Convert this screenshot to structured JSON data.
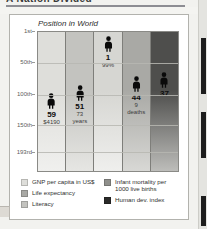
{
  "page": {
    "cut_heading": "A Nation Divided"
  },
  "chart": {
    "title": "Position in World",
    "y_axis": {
      "labels": [
        "1st",
        "50th",
        "100th",
        "150th",
        "193rd"
      ],
      "positions_pct": [
        0,
        22,
        45,
        67,
        86
      ]
    },
    "bars": [
      {
        "key": "gnp",
        "rank": "59",
        "value": "$4190",
        "value2": "",
        "color": "#dededa",
        "color_bottom": "#f0f0ee",
        "marker_top_pct": 44
      },
      {
        "key": "life-expectancy",
        "rank": "51",
        "value": "73",
        "value2": "years",
        "color": "#c3c3bf",
        "color_bottom": "#e6e6e3",
        "marker_top_pct": 38
      },
      {
        "key": "literacy",
        "rank": "1",
        "value": "99%",
        "value2": "",
        "color": "#d6d6d2",
        "color_bottom": "#efefed",
        "marker_top_pct": 3
      },
      {
        "key": "infant-mortality",
        "rank": "44",
        "value": "9",
        "value2": "deaths",
        "color": "#a9a9a5",
        "color_bottom": "#d8d8d5",
        "marker_top_pct": 32
      },
      {
        "key": "human-dev-index",
        "rank": "37",
        "value": "",
        "value2": "",
        "color": "#4e4e4c",
        "color_bottom": "#bdbdba",
        "marker_top_pct": 29
      }
    ]
  },
  "legend": {
    "left": [
      {
        "label": "GNP per capita in US$",
        "color": "#dededa"
      },
      {
        "label": "Life expectancy",
        "color": "#a9a9a5"
      },
      {
        "label": "Literacy",
        "color": "#c3c3bf"
      }
    ],
    "right": [
      {
        "label": "Infant mortality per 1000 live births",
        "color": "#8f8f8b"
      },
      {
        "label": "Human dev. index",
        "color": "#2a2a29"
      }
    ]
  }
}
